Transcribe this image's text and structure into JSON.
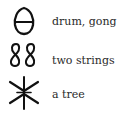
{
  "entries": [
    {
      "glyph": "drum-gong-glyph",
      "label": "drum, gong"
    },
    {
      "glyph": "two-strings-glyph",
      "label": "two strings"
    },
    {
      "glyph": "tree-glyph",
      "label": "a tree"
    }
  ]
}
